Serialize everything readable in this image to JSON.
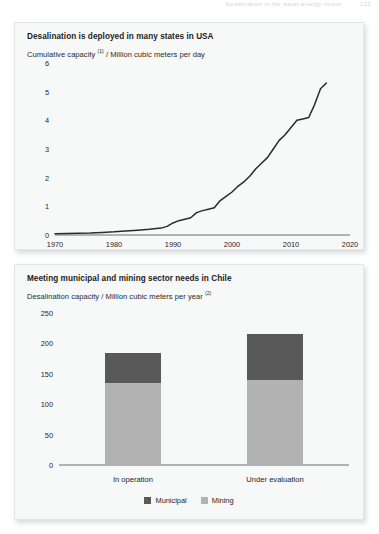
{
  "page_header": {
    "running_head": "Desalination in the water-energy nexus",
    "page_number": "123"
  },
  "panels": [
    {
      "title": "Desalination is deployed in many states in USA",
      "subtitle_main": "Cumulative capacity ",
      "subtitle_sup": "(1)",
      "subtitle_rest": " / Million cubic meters per day"
    },
    {
      "title": "Meeting municipal and mining sector needs in Chile",
      "subtitle_main": "Desalination capacity / Million cubic meters per year ",
      "subtitle_sup": "(2)",
      "subtitle_rest": ""
    }
  ],
  "legend": {
    "items": [
      {
        "label": "Municipal",
        "color": "#595959"
      },
      {
        "label": "Mining",
        "color": "#b3b3b3"
      }
    ]
  },
  "colors": {
    "panel_background": "#f7f8f8",
    "panel_border": "#e3e5e7",
    "line": "#2b2b2b",
    "municipal": "#595959",
    "mining": "#b3b3b3",
    "text": "#1d1d1d"
  },
  "chart_data": [
    {
      "type": "line",
      "title": "Desalination is deployed in many states in USA",
      "xlabel": "",
      "ylabel": "Cumulative capacity (1) / Million cubic meters per day",
      "xlim": [
        1970,
        2020
      ],
      "ylim": [
        0,
        6
      ],
      "xticks": [
        1970,
        1980,
        1990,
        2000,
        2010,
        2020
      ],
      "yticks": [
        0,
        1,
        2,
        3,
        4,
        5,
        6
      ],
      "grid": false,
      "legend_position": "none",
      "series": [
        {
          "name": "Cumulative capacity",
          "x": [
            1970,
            1972,
            1974,
            1976,
            1978,
            1980,
            1982,
            1984,
            1986,
            1988,
            1989,
            1990,
            1991,
            1992,
            1993,
            1994,
            1995,
            1996,
            1997,
            1998,
            1999,
            2000,
            2001,
            2002,
            2003,
            2004,
            2005,
            2006,
            2007,
            2008,
            2009,
            2010,
            2011,
            2012,
            2013,
            2014,
            2015,
            2016
          ],
          "y": [
            0.04,
            0.05,
            0.06,
            0.07,
            0.09,
            0.11,
            0.14,
            0.17,
            0.2,
            0.24,
            0.3,
            0.42,
            0.5,
            0.55,
            0.6,
            0.78,
            0.85,
            0.9,
            0.95,
            1.2,
            1.35,
            1.5,
            1.7,
            1.85,
            2.05,
            2.3,
            2.5,
            2.7,
            3.0,
            3.3,
            3.5,
            3.75,
            4.0,
            4.05,
            4.1,
            4.55,
            5.1,
            5.3
          ]
        }
      ]
    },
    {
      "type": "bar",
      "title": "Meeting municipal and mining sector needs in Chile",
      "xlabel": "",
      "ylabel": "Desalination capacity / Million cubic meters per year (2)",
      "ylim": [
        0,
        250
      ],
      "yticks": [
        0,
        50,
        100,
        150,
        200,
        250
      ],
      "categories": [
        "In operation",
        "Under evaluation"
      ],
      "stacked": true,
      "grid": false,
      "legend_position": "bottom",
      "series": [
        {
          "name": "Municipal",
          "values": [
            50,
            75
          ]
        },
        {
          "name": "Mining",
          "values": [
            135,
            140
          ]
        }
      ],
      "totals": [
        185,
        215
      ]
    }
  ]
}
